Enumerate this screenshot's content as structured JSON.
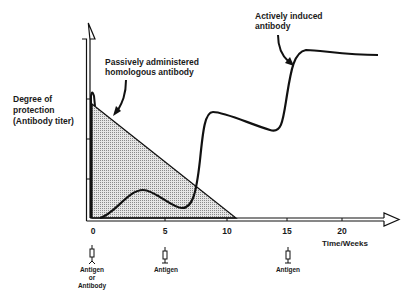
{
  "diagram": {
    "y_axis_label": [
      "Degree of",
      "protection",
      "(Antibody titer)"
    ],
    "x_axis_label": "Time/Weeks",
    "x_ticks": [
      {
        "label": "0",
        "x": 92
      },
      {
        "label": "5",
        "x": 165
      },
      {
        "label": "10",
        "x": 227
      },
      {
        "label": "15",
        "x": 287
      },
      {
        "label": "20",
        "x": 342
      }
    ],
    "annotations": {
      "passive": [
        "Passively administered",
        "homologous antibody"
      ],
      "active": [
        "Actively induced",
        "antibody"
      ]
    },
    "injections": [
      {
        "week": "0",
        "label_lines": [
          "Antigen",
          "or",
          "Antibody"
        ]
      },
      {
        "week": "5",
        "label_lines": [
          "Antigen"
        ]
      },
      {
        "week": "15",
        "label_lines": [
          "Antigen"
        ]
      }
    ],
    "colors": {
      "line": "#111111",
      "shading": "#bdbdbd"
    }
  }
}
